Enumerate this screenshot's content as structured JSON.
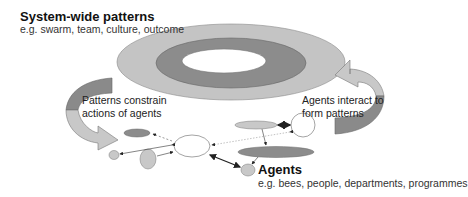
{
  "system": {
    "title": "System-wide patterns",
    "subtitle": "e.g. swarm, team, culture, outcome"
  },
  "left_arrow": {
    "line1": "Patterns constrain",
    "line2": "actions of agents"
  },
  "right_arrow": {
    "line1": "Agents interact to",
    "line2": "form patterns"
  },
  "agents": {
    "title": "Agents",
    "subtitle": "e.g. bees, people, departments, programmes"
  },
  "colors": {
    "outer_ring": "#c4c4c4",
    "middle_ring": "#8c8c8c",
    "inner_hole": "#ffffff",
    "arrow_light": "#c8c8c8",
    "arrow_dark": "#8a8a8a",
    "agent_dark": "#8c8c8c",
    "agent_light": "#c8c8c8"
  }
}
